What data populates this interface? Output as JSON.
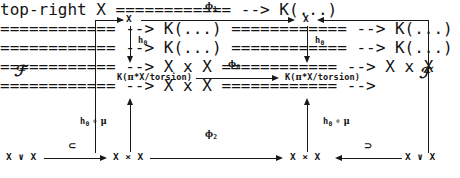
{
  "diagram": {
    "kind": "commutative-diagram",
    "width": 460,
    "height": 178,
    "ink_color": "#161616",
    "background_color": "#ffffff",
    "nodes": {
      "top_left_X": "X",
      "top_right_X": "X",
      "mid_left_K": "K(πₓX/torsion)",
      "mid_left_K_parts": {
        "head": "K(",
        "greek": "π",
        "star": "*",
        "tail": "X/torsion)"
      },
      "mid_right_K": "K(πₓX/torsion)",
      "mid_right_K_parts": {
        "head": "K(",
        "greek": "π",
        "star": "*",
        "tail": "X/torsion)"
      },
      "bottom_far_left_wedge": "X ∨ X",
      "bottom_left_product": "X × X",
      "bottom_right_product": "X × X",
      "bottom_far_right_wedge": "X ∨ X"
    },
    "arrow_labels": {
      "phi_1": {
        "symbol": "ϕ",
        "subscript": "1"
      },
      "phi_0": {
        "symbol": "ϕ",
        "subscript": "0"
      },
      "phi_2": {
        "symbol": "ϕ",
        "subscript": "2"
      },
      "h_0_left": {
        "symbol": "h",
        "subscript": "0"
      },
      "h_0_right": {
        "symbol": "h",
        "subscript": "0"
      },
      "h_0_mu_left": {
        "symbol": "h",
        "subscript": "0",
        "compose": "∘",
        "mu": "μ"
      },
      "h_0_mu_right": {
        "symbol": "h",
        "subscript": "0",
        "compose": "∘",
        "mu": "μ"
      },
      "subset_left": "⊂",
      "superset_right": "⊃",
      "script_F_left": "ℱ",
      "script_F_right": "ℱ"
    }
  }
}
